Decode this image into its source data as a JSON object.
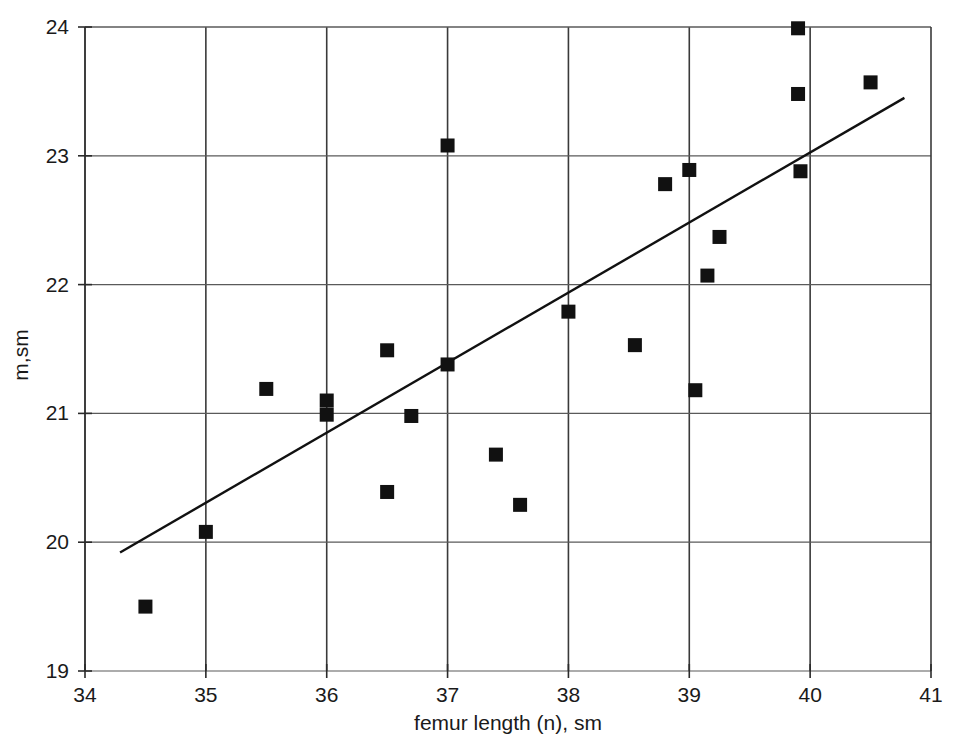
{
  "chart_data": {
    "type": "scatter",
    "title": "",
    "xlabel": "femur length (n), sm",
    "ylabel": "m,sm",
    "xlim": [
      34,
      41
    ],
    "ylim": [
      19,
      24
    ],
    "xticks": [
      34,
      35,
      36,
      37,
      38,
      39,
      40,
      41
    ],
    "yticks": [
      19,
      20,
      21,
      22,
      23,
      24
    ],
    "xtick_labels": [
      "34",
      "35",
      "36",
      "37",
      "38",
      "39",
      "40",
      "41"
    ],
    "ytick_labels": [
      "19",
      "20",
      "21",
      "22",
      "23",
      "24"
    ],
    "grid": true,
    "legend": null,
    "marker": "square",
    "marker_color": "#111111",
    "marker_size": 14,
    "line_color": "#111111",
    "points": [
      {
        "x": 34.5,
        "y": 19.5
      },
      {
        "x": 35.0,
        "y": 20.08
      },
      {
        "x": 35.5,
        "y": 21.19
      },
      {
        "x": 36.0,
        "y": 21.1
      },
      {
        "x": 36.0,
        "y": 20.99
      },
      {
        "x": 36.5,
        "y": 21.49
      },
      {
        "x": 36.5,
        "y": 20.39
      },
      {
        "x": 36.7,
        "y": 20.98
      },
      {
        "x": 37.0,
        "y": 23.08
      },
      {
        "x": 37.0,
        "y": 21.38
      },
      {
        "x": 37.4,
        "y": 20.68
      },
      {
        "x": 37.6,
        "y": 20.29
      },
      {
        "x": 38.0,
        "y": 21.79
      },
      {
        "x": 38.55,
        "y": 21.53
      },
      {
        "x": 38.8,
        "y": 22.78
      },
      {
        "x": 39.0,
        "y": 22.89
      },
      {
        "x": 39.05,
        "y": 21.18
      },
      {
        "x": 39.15,
        "y": 22.07
      },
      {
        "x": 39.25,
        "y": 22.37
      },
      {
        "x": 39.9,
        "y": 23.99
      },
      {
        "x": 39.9,
        "y": 23.48
      },
      {
        "x": 39.92,
        "y": 22.88
      },
      {
        "x": 40.5,
        "y": 23.57
      }
    ],
    "trendline": {
      "x_start": 34.29,
      "y_start": 19.92,
      "x_end": 40.78,
      "y_end": 23.45
    }
  }
}
